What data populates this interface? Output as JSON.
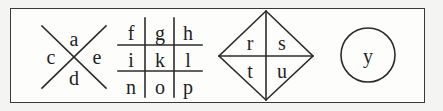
{
  "figure": {
    "background_color": "#f4f4f2",
    "panel_fill": "#fdfdfc",
    "ink_color": "#2b2b2b",
    "letter_color": "#1f1f1f"
  },
  "shapes": [
    {
      "id": "saltire",
      "name": "x-cross-shape",
      "type": "saltire",
      "letters": {
        "top": "a",
        "left": "c",
        "right": "e",
        "bottom": "d"
      }
    },
    {
      "id": "grid",
      "name": "tic-tac-toe-grid-shape",
      "type": "grid-3x3",
      "rows": [
        [
          "f",
          "g",
          "h"
        ],
        [
          "i",
          "k",
          "l"
        ],
        [
          "n",
          "o",
          "p"
        ]
      ]
    },
    {
      "id": "diamond",
      "name": "diamond-shape",
      "type": "diamond-quadrants",
      "letters": {
        "top_left": "r",
        "top_right": "s",
        "bottom_left": "t",
        "bottom_right": "u"
      }
    },
    {
      "id": "circle",
      "name": "circle-shape",
      "type": "circle",
      "letters": {
        "center": "y"
      }
    }
  ]
}
